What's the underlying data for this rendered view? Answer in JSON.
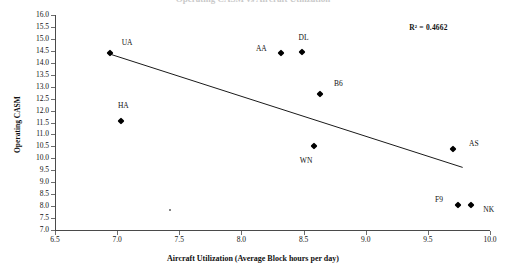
{
  "figure": {
    "clipped_top_title": "Operating CASM vs Aircraft Utilization",
    "annotation": "R² = 0.4662"
  },
  "axes": {
    "xlabel": "Aircraft Utilization (Average Block hours per day)",
    "ylabel": "Operating CASM",
    "xticks": [
      "6.5",
      "7.0",
      "7.5",
      "8.0",
      "8.5",
      "9.0",
      "9.5",
      "10.0"
    ],
    "yticks": [
      "16.0",
      "15.5",
      "15.0",
      "14.5",
      "14.0",
      "13.5",
      "13.0",
      "12.5",
      "12.0",
      "11.5",
      "11.0",
      "10.5",
      "10.0",
      "9.5",
      "9.0",
      "8.5",
      "8.0",
      "7.5",
      "7.0"
    ]
  },
  "chart_data": {
    "type": "scatter",
    "title": "",
    "xlabel": "Aircraft Utilization (Average Block hours per day)",
    "ylabel": "Operating CASM",
    "xlim": [
      6.5,
      10.0
    ],
    "ylim": [
      7.0,
      16.0
    ],
    "xtick_step": 0.5,
    "ytick_step": 0.5,
    "grid": false,
    "legend": false,
    "annotations": [
      "R² = 0.4662"
    ],
    "r_squared": 0.4662,
    "points": [
      {
        "label": "UA",
        "x": 6.94,
        "y": 14.4,
        "label_dx": 0.14,
        "label_dy": 0.42
      },
      {
        "label": "HA",
        "x": 7.03,
        "y": 11.55,
        "label_dx": 0.02,
        "label_dy": 0.62
      },
      {
        "label": "AA",
        "x": 8.32,
        "y": 14.4,
        "label_dx": -0.16,
        "label_dy": 0.18
      },
      {
        "label": "DL",
        "x": 8.49,
        "y": 14.45,
        "label_dx": 0.01,
        "label_dy": 0.6
      },
      {
        "label": "B6",
        "x": 8.63,
        "y": 12.7,
        "label_dx": 0.15,
        "label_dy": 0.42
      },
      {
        "label": "WN",
        "x": 8.58,
        "y": 10.5,
        "label_dx": -0.06,
        "label_dy": -0.62
      },
      {
        "label": "AS",
        "x": 9.7,
        "y": 10.4,
        "label_dx": 0.17,
        "label_dy": 0.22
      },
      {
        "label": "F9",
        "x": 9.74,
        "y": 8.05,
        "label_dx": -0.15,
        "label_dy": 0.22
      },
      {
        "label": "NK",
        "x": 9.85,
        "y": 8.05,
        "label_dx": 0.14,
        "label_dy": -0.2
      }
    ],
    "trendline": {
      "x0": 6.95,
      "y0": 14.35,
      "x1": 9.78,
      "y1": 9.62
    }
  }
}
